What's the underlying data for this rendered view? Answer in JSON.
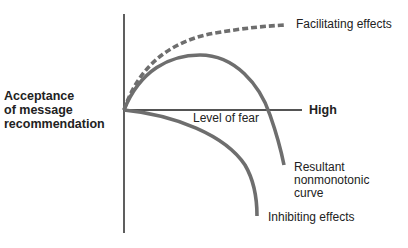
{
  "diagram": {
    "y_axis_label": [
      "Acceptance",
      "of message",
      "recommendation"
    ],
    "x_axis_label": "Level of fear",
    "x_axis_end_label": "High",
    "curves": [
      {
        "name": "Facilitating effects",
        "style": "dashed",
        "color": "#6e6e6e"
      },
      {
        "name": "Resultant nonmonotonic curve",
        "style": "solid",
        "color": "#6e6e6e"
      },
      {
        "name": "Inhibiting effects",
        "style": "solid",
        "color": "#6e6e6e"
      }
    ],
    "labels": {
      "facilitating": "Facilitating effects",
      "resultant": [
        "Resultant",
        "nonmonotonic",
        "curve"
      ],
      "inhibiting": "Inhibiting effects"
    },
    "colors": {
      "axis": "#1a1a1a",
      "curve": "#6e6e6e",
      "background": "#ffffff"
    }
  }
}
